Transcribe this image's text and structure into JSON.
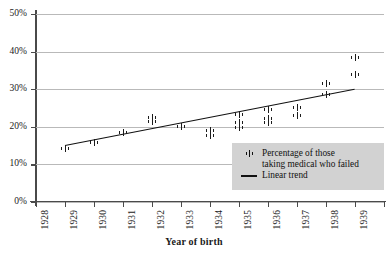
{
  "partial_top_text": "",
  "chart_data": {
    "type": "scatter",
    "title": "",
    "xlabel": "Year of birth",
    "ylabel": "",
    "xlim": [
      1928,
      1940
    ],
    "ylim": [
      0,
      50
    ],
    "ytick_labels": [
      "0%",
      "10%",
      "20%",
      "30%",
      "40%",
      "50%"
    ],
    "ytick_values": [
      0,
      10,
      20,
      30,
      40,
      50
    ],
    "xtick_labels": [
      "1928",
      "1929",
      "1930",
      "1931",
      "1932",
      "1933",
      "1934",
      "1935",
      "1936",
      "1937",
      "1938",
      "1939",
      "1940"
    ],
    "xtick_values": [
      1928,
      1929,
      1930,
      1931,
      1932,
      1933,
      1934,
      1935,
      1936,
      1937,
      1938,
      1939,
      1940
    ],
    "grid": true,
    "legend_position": "lower-right",
    "series": [
      {
        "name": "Percentage of those taking medical who failed",
        "marker": "I-beam",
        "points": [
          {
            "x": 1929,
            "y": 14.2
          },
          {
            "x": 1930,
            "y": 15.7
          },
          {
            "x": 1931,
            "y": 18.6
          },
          {
            "x": 1932,
            "y": 22.6
          },
          {
            "x": 1932,
            "y": 21.5
          },
          {
            "x": 1933,
            "y": 20.1
          },
          {
            "x": 1934,
            "y": 19.1
          },
          {
            "x": 1934,
            "y": 17.6
          },
          {
            "x": 1935,
            "y": 23.4
          },
          {
            "x": 1935,
            "y": 21.1
          },
          {
            "x": 1935,
            "y": 19.8
          },
          {
            "x": 1936,
            "y": 24.6
          },
          {
            "x": 1936,
            "y": 22.3
          },
          {
            "x": 1936,
            "y": 21.2
          },
          {
            "x": 1937,
            "y": 25.2
          },
          {
            "x": 1937,
            "y": 23.0
          },
          {
            "x": 1938,
            "y": 31.4
          },
          {
            "x": 1938,
            "y": 28.6
          },
          {
            "x": 1939,
            "y": 38.5
          },
          {
            "x": 1939,
            "y": 33.9
          }
        ]
      },
      {
        "name": "Linear trend",
        "type": "line",
        "x": [
          1929,
          1939
        ],
        "y": [
          15.2,
          30.2
        ]
      }
    ],
    "legend_entries": [
      {
        "label_line1": "Percentage of those",
        "label_line2": "taking medical who failed",
        "symbol": "I-beam"
      },
      {
        "label_line1": "Linear trend",
        "label_line2": "",
        "symbol": "line"
      }
    ]
  }
}
